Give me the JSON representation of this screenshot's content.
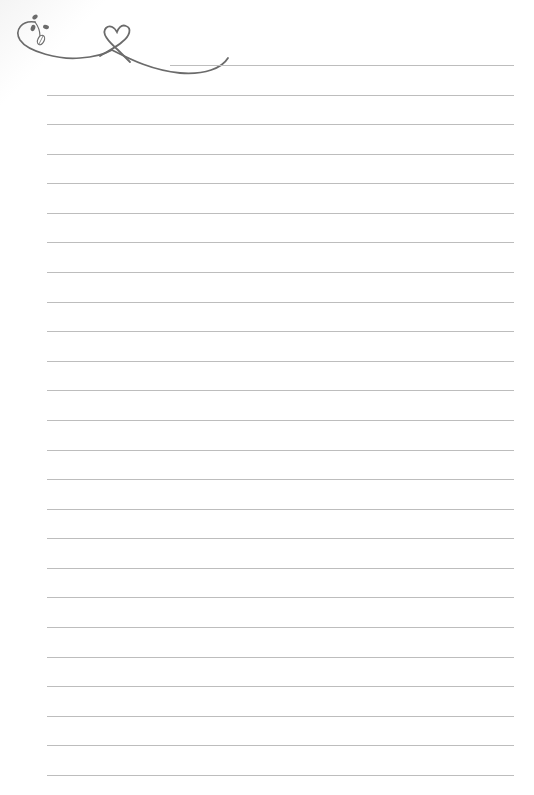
{
  "page": {
    "type": "lined-notepaper",
    "background_color": "#ffffff",
    "line_color": "#bdbdbd",
    "ornament_color": "#6b6b6b",
    "line_count": 25,
    "first_line_y": 65,
    "line_spacing": 29.58,
    "line_left": 47,
    "line_right": 514
  },
  "ornament": {
    "icons": [
      "vine-swirl-icon",
      "heart-icon",
      "leaf-icon"
    ]
  }
}
